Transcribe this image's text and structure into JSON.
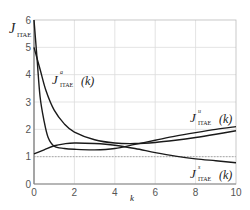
{
  "chart_data": {
    "type": "line",
    "title": "",
    "xlabel": "k",
    "ylabel": "J_ITAE",
    "xlim": [
      0,
      10
    ],
    "ylim": [
      0,
      6
    ],
    "xticks": [
      0,
      2,
      4,
      6,
      8,
      10
    ],
    "yticks": [
      0,
      1,
      2,
      3,
      4,
      5,
      6
    ],
    "grid": true,
    "reference_line": {
      "y": 1,
      "style": "dotted"
    },
    "series": [
      {
        "name": "J^a_ITAE(k)",
        "x": [
          0,
          0.3,
          0.6,
          1,
          1.5,
          2,
          3,
          4,
          5,
          6,
          7,
          8,
          9,
          10
        ],
        "values": [
          5.0,
          4.2,
          3.4,
          2.7,
          2.2,
          1.9,
          1.62,
          1.5,
          1.48,
          1.52,
          1.6,
          1.7,
          1.82,
          1.95
        ]
      },
      {
        "name": "J^u_ITAE(k)",
        "x": [
          0,
          0.15,
          0.3,
          0.5,
          0.7,
          1,
          1.5,
          2,
          3,
          4,
          5,
          6,
          7,
          8,
          9,
          10
        ],
        "values": [
          6.0,
          4.6,
          3.2,
          2.3,
          1.7,
          1.38,
          1.3,
          1.27,
          1.25,
          1.3,
          1.45,
          1.6,
          1.75,
          1.88,
          2.0,
          2.1
        ]
      },
      {
        "name": "J^s_ITAE(k)",
        "x": [
          0,
          0.5,
          1,
          1.5,
          2,
          3,
          4,
          5,
          6,
          7,
          8,
          9,
          10
        ],
        "values": [
          1.1,
          1.25,
          1.4,
          1.47,
          1.5,
          1.48,
          1.42,
          1.3,
          1.15,
          1.02,
          0.92,
          0.85,
          0.78
        ]
      }
    ],
    "annotations": [
      {
        "text": "J^a_ITAE(k)",
        "x": 0.8,
        "y": 3.9
      },
      {
        "text": "J^u_ITAE(k)",
        "x": 7.8,
        "y": 2.4
      },
      {
        "text": "J^s_ITAE(k)",
        "x": 7.8,
        "y": 0.4
      }
    ]
  },
  "labels": {
    "ylabel_main": "J",
    "ylabel_sub": "ITAE",
    "xlabel": "k",
    "ann_a_sup": "a",
    "ann_u_sup": "u",
    "ann_s_sup": "s",
    "ann_sub": "ITAE",
    "ann_arg": "(k)"
  }
}
